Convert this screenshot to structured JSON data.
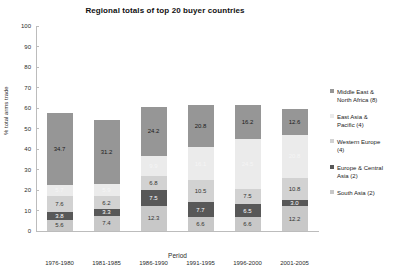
{
  "chart_data": {
    "type": "bar",
    "stacked": true,
    "title": "Regional totals of top 20 buyer countries",
    "xlabel": "Period",
    "ylabel": "% total arms trade",
    "ylim": [
      0,
      100
    ],
    "ytick_labels": [
      "0",
      "10",
      "20",
      "30",
      "40",
      "50",
      "60",
      "70",
      "80",
      "90",
      "100"
    ],
    "ytick_values": [
      0,
      10,
      20,
      30,
      40,
      50,
      60,
      70,
      80,
      90,
      100
    ],
    "grid": false,
    "legend_position": "right",
    "categories": [
      "1976-1980",
      "1981-1985",
      "1986-1990",
      "1991-1995",
      "1996-2000",
      "2001-2005"
    ],
    "series": [
      {
        "name": "South Asia (2)",
        "color": "#c8c8c8",
        "values": [
          5.6,
          7.4,
          12.3,
          6.6,
          6.6,
          12.2
        ],
        "labels": [
          "5.6",
          "7.4",
          "12.3",
          "6.6",
          "6.6",
          "12.2"
        ],
        "label_color": "#333333"
      },
      {
        "name": "Europe & Central Asia (2)",
        "color": "#585858",
        "values": [
          3.8,
          3.3,
          7.5,
          7.7,
          6.5,
          3.0
        ],
        "labels": [
          "3.8",
          "3.3",
          "7.5",
          "7.7",
          "6.5",
          "3.0"
        ],
        "label_color": "#ffffff"
      },
      {
        "name": "Western Europe (4)",
        "color": "#d2d2d2",
        "values": [
          7.6,
          6.2,
          6.8,
          10.5,
          7.5,
          10.8
        ],
        "labels": [
          "7.6",
          "6.2",
          "6.8",
          "10.5",
          "7.5",
          "10.8"
        ],
        "label_color": "#333333"
      },
      {
        "name": "East Asia & Pacific (4)",
        "color": "#ebebeb",
        "values": [
          5.7,
          5.9,
          9.9,
          16.1,
          24.5,
          20.8
        ],
        "labels": [
          "5.7",
          "5.9",
          "9.9",
          "16.1",
          "24.5",
          "20.8"
        ],
        "label_color": "#f5f5f5"
      },
      {
        "name": "Middle East & North Africa (8)",
        "color": "#969696",
        "values": [
          34.7,
          31.2,
          24.2,
          20.8,
          16.2,
          12.6
        ],
        "labels": [
          "34.7",
          "31.2",
          "24.2",
          "20.8",
          "16.2",
          "12.6"
        ],
        "label_color": "#1a1a1a"
      }
    ]
  },
  "legend": {
    "items": [
      {
        "label": "Middle East &\nNorth Africa (8)",
        "color": "#969696"
      },
      {
        "label": "East Asia &\nPacific (4)",
        "color": "#ebebeb"
      },
      {
        "label": "Western Europe\n(4)",
        "color": "#d2d2d2"
      },
      {
        "label": "Europe & Central\nAsia (2)",
        "color": "#585858"
      },
      {
        "label": "South Asia (2)",
        "color": "#c8c8c8"
      }
    ]
  }
}
